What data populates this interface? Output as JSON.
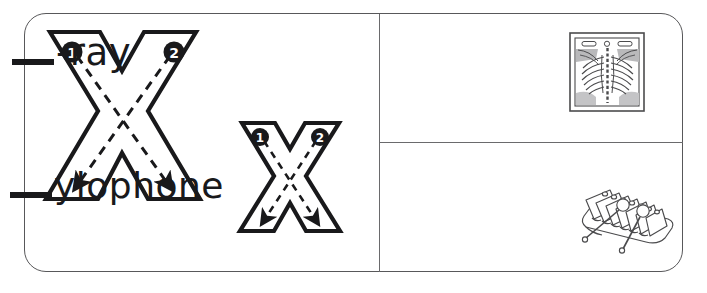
{
  "worksheet": {
    "letter": "X",
    "title": "Letter X tracing and picture worksheet",
    "ink_color": "#19191b",
    "border_color": "#58585a"
  },
  "tracing_panel": {
    "name": "letter-x-tracing-area",
    "uppercase": {
      "glyph": "X",
      "case": "uppercase",
      "strokes": [
        {
          "number": "1",
          "marker_label": "1",
          "direction": "down-right to down-left",
          "start": "top-left",
          "end": "bottom-right"
        },
        {
          "number": "2",
          "marker_label": "2",
          "direction": "down-left to down-right",
          "start": "top-right",
          "end": "bottom-left"
        }
      ]
    },
    "lowercase": {
      "glyph": "x",
      "case": "lowercase",
      "strokes": [
        {
          "number": "1",
          "marker_label": "1",
          "start": "top-left",
          "end": "bottom-right"
        },
        {
          "number": "2",
          "marker_label": "2",
          "start": "top-right",
          "end": "bottom-left"
        }
      ]
    }
  },
  "word_panels": [
    {
      "id": "ray",
      "blank": "__",
      "word_remainder": "-ray",
      "full_word": "x-ray",
      "picture": "xray-film-icon",
      "picture_label": "x-ray film of a ribcage"
    },
    {
      "id": "xylophone",
      "blank": "__",
      "word_remainder": "ylophone",
      "full_word": "xylophone",
      "picture": "xylophone-icon",
      "picture_label": "xylophone with two mallets"
    }
  ]
}
